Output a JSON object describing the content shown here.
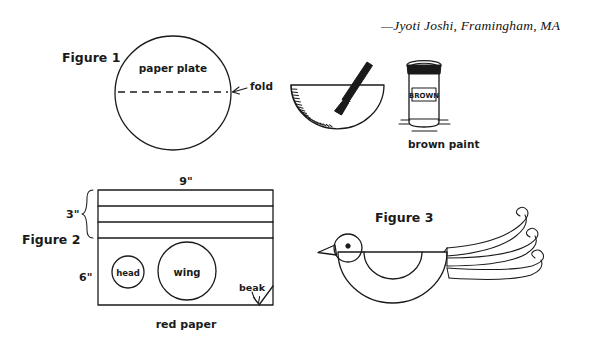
{
  "page": {
    "background_color": "#ffffff",
    "ink_color": "#1a1a1a",
    "attribution": "—Jyoti Joshi, Framingham, MA"
  },
  "figure1": {
    "label": "Figure 1",
    "shape_label": "paper plate",
    "fold_label": "fold",
    "caption": ""
  },
  "paint_step": {
    "jar_label": "BROWN",
    "caption": "brown paint",
    "brush_name": "paintbrush",
    "plate_name": "folded-paper-plate"
  },
  "figure2": {
    "label": "Figure 2",
    "width_label": "9\"",
    "strip_height_label": "3\"",
    "body_height_label": "6\"",
    "head_label": "head",
    "wing_label": "wing",
    "beak_label": "beak",
    "caption": "red paper",
    "strip_count": 3
  },
  "figure3": {
    "label": "Figure 3",
    "bird_name": "finished-paper-plate-bird",
    "streamer_count": 3
  }
}
